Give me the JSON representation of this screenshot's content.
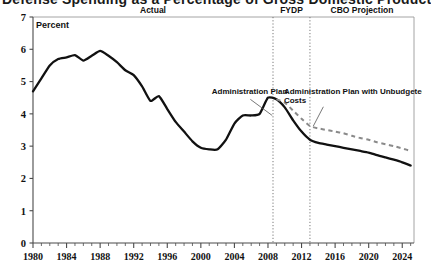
{
  "figure": {
    "title": "Defense Spending as a Percentage of Gross Domestic Product",
    "title_visible_fragment": "ross Domestic Product",
    "unit_label": "Percent"
  },
  "zones": [
    {
      "key": "actual",
      "label": "Actual",
      "start_year": 1980,
      "end_year": 2008.6
    },
    {
      "key": "fydp",
      "label": "FYDP",
      "start_year": 2008.6,
      "end_year": 2013.0
    },
    {
      "key": "cbo",
      "label": "CBO Projection",
      "start_year": 2013.0,
      "end_year": 2025.4
    }
  ],
  "dividers": [
    2008.6,
    2013.0
  ],
  "annotations": [
    {
      "key": "admin-plan",
      "lines": [
        "Administration Plan"
      ],
      "text_x": 2001.3,
      "text_y": 4.62,
      "leader_from": [
        2005.9,
        4.45
      ],
      "leader_to": [
        2008.5,
        3.95
      ]
    },
    {
      "key": "admin-plan-unbudgeted",
      "lines": [
        "Administration Plan with Unbudgeted",
        "Costs"
      ],
      "text_x": 2009.9,
      "text_y": 4.62,
      "leader_from": [
        2014.6,
        4.22
      ],
      "leader_to": [
        2013.4,
        3.62
      ]
    }
  ],
  "colors": {
    "solid_line": "#111111",
    "dashed_line": "#8a8a8a",
    "axis": "#4a4a4a",
    "frame": "#9a9a9a",
    "divider": "#6a6a6a",
    "background": "#ffffff"
  },
  "chart_data": {
    "type": "line",
    "title": "Defense Spending as a Percentage of Gross Domestic Product",
    "xlabel": "",
    "ylabel": "Percent",
    "xlim": [
      1980,
      2025.4
    ],
    "ylim": [
      0,
      7
    ],
    "yticks": [
      0,
      1,
      2,
      3,
      4,
      5,
      6,
      7
    ],
    "xticks": [
      1980,
      1984,
      1988,
      1992,
      1996,
      2000,
      2004,
      2008,
      2012,
      2016,
      2020,
      2024
    ],
    "grid": false,
    "legend": "none",
    "series": [
      {
        "name": "Administration Plan",
        "style": "solid",
        "color": "#111111",
        "x": [
          1980,
          1981,
          1982,
          1983,
          1984,
          1985,
          1986,
          1987,
          1988,
          1989,
          1990,
          1991,
          1992,
          1993,
          1994,
          1995,
          1996,
          1997,
          1998,
          1999,
          2000,
          2001,
          2002,
          2003,
          2004,
          2005,
          2006,
          2007,
          2008,
          2009,
          2010,
          2011,
          2012,
          2013,
          2014,
          2015,
          2016,
          2017,
          2018,
          2019,
          2020,
          2021,
          2022,
          2023,
          2024,
          2025
        ],
        "values": [
          4.7,
          5.1,
          5.5,
          5.7,
          5.75,
          5.82,
          5.65,
          5.8,
          5.95,
          5.8,
          5.6,
          5.35,
          5.2,
          4.85,
          4.4,
          4.55,
          4.15,
          3.75,
          3.45,
          3.15,
          2.95,
          2.9,
          2.9,
          3.2,
          3.7,
          3.95,
          3.95,
          4.0,
          4.5,
          4.45,
          4.2,
          3.8,
          3.45,
          3.2,
          3.1,
          3.05,
          3.0,
          2.95,
          2.9,
          2.85,
          2.8,
          2.72,
          2.65,
          2.58,
          2.5,
          2.4
        ]
      },
      {
        "name": "Administration Plan with Unbudgeted Costs",
        "style": "dashed",
        "color": "#8a8a8a",
        "x": [
          2009,
          2010,
          2011,
          2012,
          2013,
          2014,
          2015,
          2016,
          2017,
          2018,
          2019,
          2020,
          2021,
          2022,
          2023,
          2024,
          2025
        ],
        "values": [
          4.45,
          4.35,
          4.1,
          3.85,
          3.62,
          3.55,
          3.5,
          3.45,
          3.4,
          3.32,
          3.25,
          3.2,
          3.12,
          3.06,
          3.0,
          2.93,
          2.85
        ]
      }
    ]
  }
}
